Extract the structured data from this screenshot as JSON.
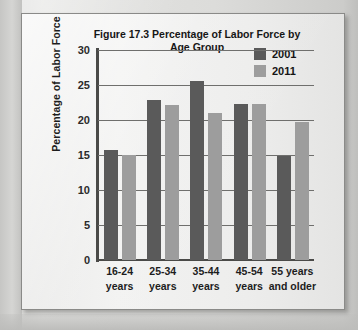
{
  "figure": {
    "title_line1": "Figure 17.3 Percentage of Labor Force",
    "title_line2": "by Age Group"
  },
  "colors": {
    "series_2001": "#5a5a5a",
    "series_2011": "#9d9d9d",
    "axis": "#4a4a48",
    "grid": "#6f6f6d",
    "plot_background": "#efefee",
    "page_background": "#d9d9d7"
  },
  "chart_data": {
    "type": "bar",
    "title": "Figure 17.3 Percentage of Labor Force by Age Group",
    "xlabel": "",
    "ylabel": "Percentage of Labor Force",
    "ylim": [
      0,
      30
    ],
    "yticks": [
      0,
      5,
      10,
      15,
      20,
      25,
      30
    ],
    "ytick_labels": [
      "0",
      "5",
      "10",
      "15",
      "20",
      "25",
      "30"
    ],
    "grid": true,
    "legend_position": "top-right",
    "categories": [
      "16-24 years",
      "25-34 years",
      "35-44 years",
      "45-54 years",
      "55 years and older"
    ],
    "category_lines": [
      [
        "16-24",
        "years"
      ],
      [
        "25-34",
        "years"
      ],
      [
        "35-44",
        "years"
      ],
      [
        "45-54",
        "years"
      ],
      [
        "55 years",
        "and older"
      ]
    ],
    "series": [
      {
        "name": "2001",
        "color": "#5a5a5a",
        "values": [
          15.7,
          22.9,
          25.6,
          22.3,
          14.8
        ]
      },
      {
        "name": "2011",
        "color": "#9d9d9d",
        "values": [
          15.0,
          22.2,
          21.0,
          22.3,
          19.7
        ]
      }
    ]
  }
}
